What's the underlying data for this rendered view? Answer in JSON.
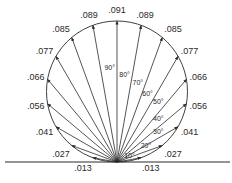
{
  "diagram": {
    "type": "polar-distribution",
    "origin": {
      "x": 117,
      "y": 162
    },
    "diameter": 141,
    "baseline": {
      "x1": 5,
      "x2": 230,
      "y": 162
    },
    "colors": {
      "ink": "#2a2a2a",
      "background": "#ffffff"
    },
    "rays": [
      {
        "angle": 10,
        "value": ".013",
        "angle_label": "10°"
      },
      {
        "angle": 20,
        "value": ".027",
        "angle_label": "20°"
      },
      {
        "angle": 30,
        "value": ".041",
        "angle_label": "30°"
      },
      {
        "angle": 40,
        "value": ".056",
        "angle_label": "40°"
      },
      {
        "angle": 50,
        "value": ".066",
        "angle_label": "50°"
      },
      {
        "angle": 60,
        "value": ".077",
        "angle_label": "60°"
      },
      {
        "angle": 70,
        "value": ".085",
        "angle_label": "70°"
      },
      {
        "angle": 80,
        "value": ".089",
        "angle_label": "80°"
      },
      {
        "angle": 90,
        "value": ".091",
        "angle_label": "90°"
      },
      {
        "angle": 100,
        "value": ".089",
        "angle_label": ""
      },
      {
        "angle": 110,
        "value": ".085",
        "angle_label": ""
      },
      {
        "angle": 120,
        "value": ".077",
        "angle_label": ""
      },
      {
        "angle": 130,
        "value": ".066",
        "angle_label": ""
      },
      {
        "angle": 140,
        "value": ".056",
        "angle_label": ""
      },
      {
        "angle": 150,
        "value": ".041",
        "angle_label": ""
      },
      {
        "angle": 160,
        "value": ".027",
        "angle_label": ""
      },
      {
        "angle": 170,
        "value": ".013",
        "angle_label": ""
      }
    ]
  }
}
